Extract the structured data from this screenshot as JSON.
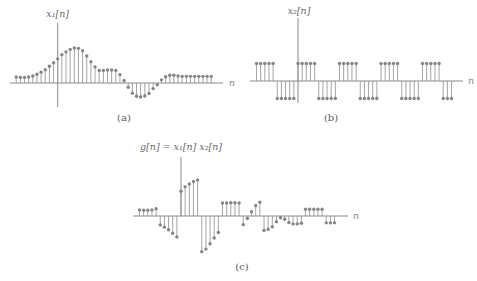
{
  "figure": {
    "panels": [
      {
        "id": "a",
        "caption": "(a)",
        "signal_label": "x₁[n]",
        "axis_label": "n"
      },
      {
        "id": "b",
        "caption": "(b)",
        "signal_label": "x₂[n]",
        "axis_label": "n"
      },
      {
        "id": "c",
        "caption": "(c)",
        "signal_label": "g[n] = x₁[n] x₂[n]",
        "axis_label": "n"
      }
    ]
  },
  "colors": {
    "stem": "#9a9a9a",
    "dot": "#858585",
    "axis": "#7a7a7a",
    "text": "#6a6a6a"
  },
  "chart_data": [
    {
      "type": "stem",
      "title": "(a)",
      "ylabel": "x₁[n]",
      "xlabel": "n",
      "n_start": -10,
      "x": [
        -10,
        -9,
        -8,
        -7,
        -6,
        -5,
        -4,
        -3,
        -2,
        -1,
        0,
        1,
        2,
        3,
        4,
        5,
        6,
        7,
        8,
        9,
        10,
        11,
        12,
        13,
        14,
        15,
        16,
        17,
        18,
        19,
        20,
        21,
        22,
        23,
        24,
        25,
        26,
        27,
        28,
        29,
        30,
        31,
        32,
        33,
        34,
        35,
        36,
        37
      ],
      "values": [
        0.17,
        0.16,
        0.16,
        0.17,
        0.2,
        0.25,
        0.31,
        0.38,
        0.48,
        0.58,
        0.69,
        0.81,
        0.89,
        0.96,
        1.0,
        0.99,
        0.92,
        0.77,
        0.61,
        0.46,
        0.36,
        0.36,
        0.37,
        0.37,
        0.36,
        0.24,
        0.07,
        -0.12,
        -0.29,
        -0.38,
        -0.4,
        -0.37,
        -0.3,
        -0.16,
        -0.05,
        0.09,
        0.18,
        0.22,
        0.22,
        0.2,
        0.19,
        0.19,
        0.19,
        0.19,
        0.19,
        0.19,
        0.19,
        0.19
      ],
      "grid": false
    },
    {
      "type": "stem",
      "title": "(b)",
      "ylabel": "x₂[n]",
      "xlabel": "n",
      "n_start": -10,
      "x": [
        -10,
        -9,
        -8,
        -7,
        -6,
        -5,
        -4,
        -3,
        -2,
        -1,
        0,
        1,
        2,
        3,
        4,
        5,
        6,
        7,
        8,
        9,
        10,
        11,
        12,
        13,
        14,
        15,
        16,
        17,
        18,
        19,
        20,
        21,
        22,
        23,
        24,
        25,
        26,
        27,
        28,
        29,
        30,
        31,
        32,
        33,
        34,
        35,
        36,
        37
      ],
      "values": [
        1,
        1,
        1,
        1,
        1,
        -1,
        -1,
        -1,
        -1,
        -1,
        1,
        1,
        1,
        1,
        1,
        -1,
        -1,
        -1,
        -1,
        -1,
        1,
        1,
        1,
        1,
        1,
        -1,
        -1,
        -1,
        -1,
        -1,
        1,
        1,
        1,
        1,
        1,
        -1,
        -1,
        -1,
        -1,
        -1,
        1,
        1,
        1,
        1,
        1,
        -1,
        -1,
        -1
      ],
      "period": 10,
      "grid": false
    },
    {
      "type": "stem",
      "title": "(c)",
      "ylabel": "g[n] = x₁[n] x₂[n]",
      "xlabel": "n",
      "n_start": -10,
      "x": [
        -10,
        -9,
        -8,
        -7,
        -6,
        -5,
        -4,
        -3,
        -2,
        -1,
        0,
        1,
        2,
        3,
        4,
        5,
        6,
        7,
        8,
        9,
        10,
        11,
        12,
        13,
        14,
        15,
        16,
        17,
        18,
        19,
        20,
        21,
        22,
        23,
        24,
        25,
        26,
        27,
        28,
        29,
        30,
        31,
        32,
        33,
        34,
        35,
        36,
        37
      ],
      "values": [
        0.17,
        0.16,
        0.16,
        0.17,
        0.2,
        -0.25,
        -0.31,
        -0.38,
        -0.48,
        -0.58,
        0.69,
        0.81,
        0.89,
        0.96,
        1.0,
        -0.99,
        -0.92,
        -0.77,
        -0.61,
        -0.46,
        0.36,
        0.36,
        0.37,
        0.37,
        0.36,
        -0.24,
        -0.07,
        0.12,
        0.29,
        0.38,
        -0.4,
        -0.37,
        -0.3,
        -0.16,
        -0.05,
        -0.09,
        -0.18,
        -0.22,
        -0.22,
        -0.2,
        0.19,
        0.19,
        0.19,
        0.19,
        0.19,
        -0.19,
        -0.19,
        -0.19
      ],
      "grid": false
    }
  ]
}
